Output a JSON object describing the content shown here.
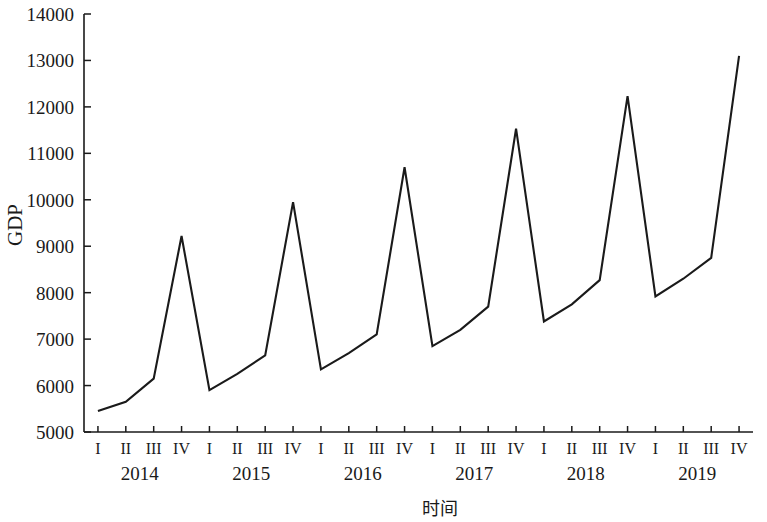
{
  "chart_data": {
    "type": "line",
    "title": "",
    "subtitle": "",
    "xlabel": "时间",
    "ylabel": "GDP",
    "ylim": [
      5000,
      14000
    ],
    "ytick_step": 1000,
    "grid": false,
    "legend": "none",
    "line_color": "#1a1a1a",
    "ytick_labels": [
      "14000",
      "13000",
      "12000",
      "11000",
      "10000",
      "9000",
      "8000",
      "7000",
      "6000",
      "5000"
    ],
    "ytick_values": [
      14000,
      13000,
      12000,
      11000,
      10000,
      9000,
      8000,
      7000,
      6000,
      5000
    ],
    "quarter_labels": [
      "I",
      "II",
      "III",
      "IV"
    ],
    "years": [
      "2014",
      "2015",
      "2016",
      "2017",
      "2018",
      "2019"
    ],
    "categories": [
      "2014 I",
      "2014 II",
      "2014 III",
      "2014 IV",
      "2015 I",
      "2015 II",
      "2015 III",
      "2015 IV",
      "2016 I",
      "2016 II",
      "2016 III",
      "2016 IV",
      "2017 I",
      "2017 II",
      "2017 III",
      "2017 IV",
      "2018 I",
      "2018 II",
      "2018 III",
      "2018 IV",
      "2019 I",
      "2019 II",
      "2019 III",
      "2019 IV"
    ],
    "series": [
      {
        "name": "GDP",
        "values": [
          5450,
          5650,
          6150,
          9220,
          5900,
          6250,
          6650,
          9950,
          6350,
          6700,
          7100,
          10700,
          6850,
          7200,
          7700,
          11530,
          7380,
          7750,
          8270,
          12230,
          7920,
          8300,
          8750,
          13100
        ]
      }
    ]
  }
}
